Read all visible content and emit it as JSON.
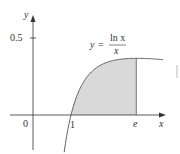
{
  "chart_data": {
    "type": "area",
    "title": "",
    "function_label": {
      "lhs": "y",
      "eq": "=",
      "numerator": "ln x",
      "denominator": "x"
    },
    "xlabel": "x",
    "ylabel": "y",
    "origin_label": "0",
    "x_ticks": [
      {
        "value": 1,
        "label": "1"
      },
      {
        "value": 2.718,
        "label": "e"
      }
    ],
    "y_ticks": [
      {
        "value": 0.5,
        "label": "0.5"
      }
    ],
    "curve": {
      "expression": "ln(x)/x",
      "x_range": [
        0.82,
        3.42
      ],
      "points": [
        [
          0.82,
          -0.242
        ],
        [
          0.9,
          -0.117
        ],
        [
          1.0,
          0.0
        ],
        [
          1.2,
          0.152
        ],
        [
          1.4,
          0.24
        ],
        [
          1.6,
          0.294
        ],
        [
          1.8,
          0.327
        ],
        [
          2.0,
          0.347
        ],
        [
          2.3,
          0.362
        ],
        [
          2.718,
          0.368
        ],
        [
          3.0,
          0.366
        ],
        [
          3.42,
          0.36
        ]
      ]
    },
    "shaded_region": {
      "from": 1,
      "to": 2.718,
      "color": "#d9d9d9"
    },
    "xlim": [
      -0.8,
      3.5
    ],
    "ylim": [
      -0.22,
      0.65
    ],
    "grid": false,
    "legend": null
  },
  "colors": {
    "axis": "#333333",
    "curve": "#555555",
    "shade": "#dcdcdc"
  }
}
